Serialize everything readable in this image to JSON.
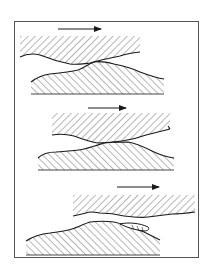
{
  "diagram": {
    "type": "sliding-surfaces-schematic",
    "panel_count": 3,
    "colors": {
      "line": "#1a1a1a",
      "frame": "#555555",
      "hatch": "#2a2a2a",
      "background": "#ffffff"
    },
    "panels": [
      {
        "id": 1,
        "arrow": "right",
        "description": "upper hatched body sliding right over lower hatched body, surfaces separated"
      },
      {
        "id": 2,
        "arrow": "right",
        "description": "upper body in contact with lower body along crossing rough surfaces"
      },
      {
        "id": 3,
        "arrow": "right",
        "description": "upper body shifted right, wear particle/debris lens forming between surfaces"
      }
    ]
  },
  "caption": {
    "text": ""
  }
}
